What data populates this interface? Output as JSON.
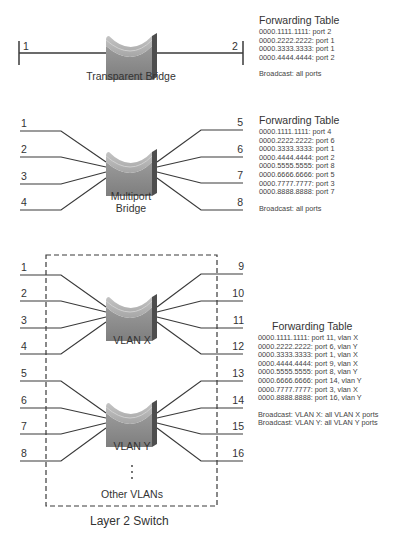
{
  "sections": {
    "transparent": {
      "bridge_label": "Transparent Bridge",
      "ports": [
        "1",
        "2"
      ],
      "table": {
        "title": "Forwarding Table",
        "rows": [
          "0000.1111.1111: port 2",
          "0000.2222.2222: port 1",
          "0000.3333.3333: port 1",
          "0000.4444.4444: port 2"
        ],
        "broadcast": [
          "Broadcast: all ports"
        ]
      }
    },
    "multiport": {
      "bridge_label_line1": "Multiport",
      "bridge_label_line2": "Bridge",
      "ports_left": [
        "1",
        "2",
        "3",
        "4"
      ],
      "ports_right": [
        "5",
        "6",
        "7",
        "8"
      ],
      "table": {
        "title": "Forwarding Table",
        "rows": [
          "0000.1111.1111: port 4",
          "0000.2222.2222: port 6",
          "0000.3333.3333: port 1",
          "0000.4444.4444: port 2",
          "0000.5555.5555: port 8",
          "0000.6666.6666: port 5",
          "0000.7777.7777: port 3",
          "0000.8888.8888: port 7"
        ],
        "broadcast": [
          "Broadcast: all ports"
        ]
      }
    },
    "switch": {
      "title": "Layer 2 Switch",
      "other_vlans_label": "Other VLANs",
      "vlan_x": {
        "label": "VLAN X",
        "ports_left": [
          "1",
          "2",
          "3",
          "4"
        ],
        "ports_right": [
          "9",
          "10",
          "11",
          "12"
        ]
      },
      "vlan_y": {
        "label": "VLAN Y",
        "ports_left": [
          "5",
          "6",
          "7",
          "8"
        ],
        "ports_right": [
          "13",
          "14",
          "15",
          "16"
        ]
      },
      "table": {
        "title": "Forwarding Table",
        "rows": [
          "0000.1111.1111: port 11, vlan X",
          "0000.2222.2222: port 6, vlan Y",
          "0000.3333.3333: port 1, vlan X",
          "0000.4444.4444: port 9, vlan X",
          "0000.5555.5555: port 8, vlan Y",
          "0000.6666.6666: port 14, vlan Y",
          "0000.7777.7777: port 3, vlan X",
          "0000.8888.8888: port 16, vlan Y"
        ],
        "broadcast": [
          "Broadcast: VLAN X: all VLAN X ports",
          "Broadcast: VLAN Y: all VLAN Y ports"
        ]
      }
    }
  },
  "colors": {
    "line": "#3a3a3a",
    "bridge_front": "#8c8c8c",
    "bridge_top": "#b5b5b5",
    "bridge_side": "#4e4e4e"
  }
}
